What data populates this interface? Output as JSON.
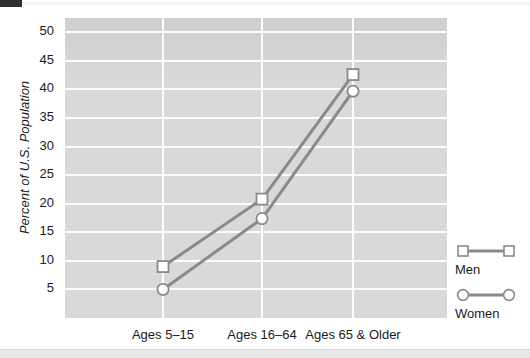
{
  "chart_data": {
    "type": "line",
    "title": "",
    "xlabel": "",
    "ylabel": "Percent of U.S. Population",
    "categories": [
      "Ages 5–15",
      "Ages 16–64",
      "Ages 65 & Older"
    ],
    "series": [
      {
        "name": "Men",
        "marker": "square",
        "values": [
          9.0,
          20.8,
          42.6
        ]
      },
      {
        "name": "Women",
        "marker": "circle",
        "values": [
          5.0,
          17.4,
          39.7
        ]
      }
    ],
    "ylim": [
      0,
      52.5
    ],
    "yticks": [
      5,
      10,
      15,
      20,
      25,
      30,
      35,
      40,
      45,
      50
    ],
    "ytick_labels": [
      "5",
      "10",
      "15",
      "20",
      "25",
      "30",
      "35",
      "40",
      "45",
      "50"
    ],
    "grid": true,
    "grid_color": "#fdfdfd",
    "plot_background": "#d9d9d9",
    "line_color": "#8a8a8a",
    "marker_face_color": "#ffffff",
    "legend_position": "right"
  },
  "legend": {
    "entries": [
      {
        "label": "Men",
        "marker": "square-marker-icon"
      },
      {
        "label": "Women",
        "marker": "circle-marker-icon"
      }
    ]
  }
}
